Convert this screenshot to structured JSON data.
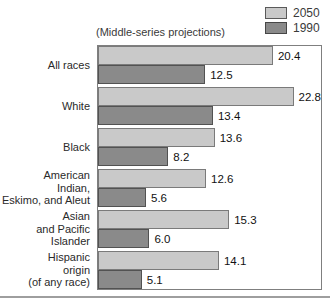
{
  "title": "(Middle-series projections)",
  "legend": {
    "items": [
      {
        "label": "2050",
        "color": "#c9c9c9",
        "border": "#5a5a5a"
      },
      {
        "label": "1990",
        "color": "#8a8a8a",
        "border": "#474747"
      }
    ]
  },
  "chart_data": {
    "type": "bar",
    "orientation": "horizontal",
    "title": "(Middle-series projections)",
    "categories": [
      "All races",
      "White",
      "Black",
      "American\nIndian,\nEskimo, and Aleut",
      "Asian\nand Pacific\nIslander",
      "Hispanic\norigin\n(of any race)"
    ],
    "series": [
      {
        "name": "2050",
        "color": "#c9c9c9",
        "border_color": "#7a7a7a",
        "values": [
          20.4,
          22.8,
          13.6,
          12.6,
          15.3,
          14.1
        ],
        "labels": [
          "20.4",
          "22.8",
          "13.6",
          "12.6",
          "15.3",
          "14.1"
        ]
      },
      {
        "name": "1990",
        "color": "#8a8a8a",
        "border_color": "#525252",
        "values": [
          12.5,
          13.4,
          8.2,
          5.6,
          6.0,
          5.1
        ],
        "labels": [
          "12.5",
          "13.4",
          "8.2",
          "5.6",
          "6.0",
          "5.1"
        ]
      }
    ],
    "xlim": [
      0,
      26
    ],
    "grid": false,
    "legend_position": "top-right",
    "value_labels": true
  }
}
